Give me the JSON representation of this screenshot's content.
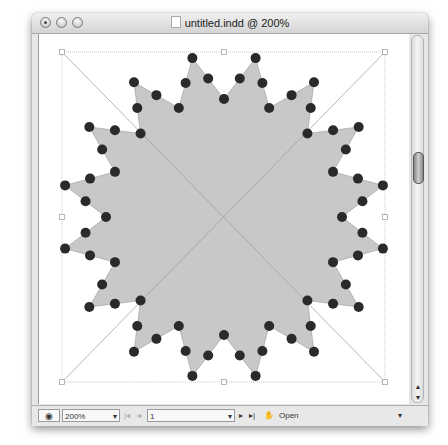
{
  "window": {
    "title": "untitled.indd @ 200%",
    "traffic_lights": [
      "close",
      "minimize",
      "zoom"
    ]
  },
  "document": {
    "shape": "16-point star polygon with path anchor points",
    "frame_bounds": {
      "left": 62,
      "top": 52,
      "right": 385,
      "bottom": 382
    },
    "center": {
      "x": 224,
      "y": 217
    },
    "fill_color": "#c8c8c8",
    "anchor_color": "#2a2a2a",
    "tips": 16
  },
  "statusbar": {
    "preview_icon": "eye-icon",
    "zoom_value": "200%",
    "first_page_icon": "first-page-icon",
    "prev_page_icon": "prev-page-icon",
    "page_value": "1",
    "next_page_icon": "next-page-icon",
    "last_page_icon": "last-page-icon",
    "open_label": "Open",
    "menu_icon": "menu-arrow-icon"
  },
  "scrollbar": {
    "up_arrow": "▲",
    "down_arrow": "▼"
  }
}
